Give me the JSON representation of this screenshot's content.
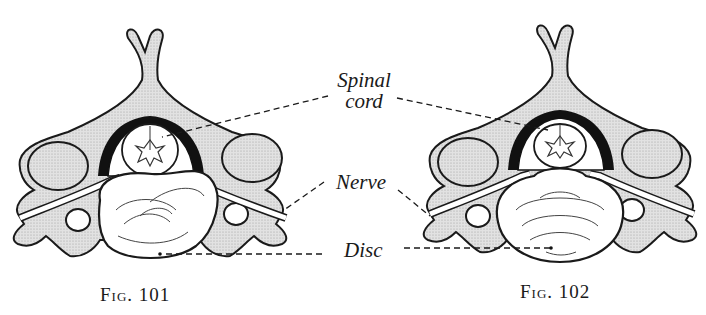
{
  "figures": [
    {
      "id": "fig-101",
      "caption": "Fig. 101"
    },
    {
      "id": "fig-102",
      "caption": "Fig. 102"
    }
  ],
  "labels": {
    "spinal_cord_line1": "Spinal",
    "spinal_cord_line2": "cord",
    "nerve": "Nerve",
    "disc": "Disc"
  },
  "colors": {
    "ink": "#1a1a1a",
    "bone_fill": "#d9d9d9",
    "background": "#ffffff"
  }
}
